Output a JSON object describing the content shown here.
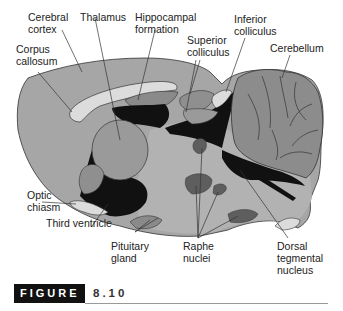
{
  "diagram": {
    "colors": {
      "tissue": "#a6a6a6",
      "tissue_light": "#c4c4c4",
      "white_matter": "#dcdcdc",
      "ventricle": "#111111",
      "nucleus_dark": "#5e5e5e",
      "outline": "#333333"
    },
    "labels": [
      {
        "id": "cerebral-cortex",
        "text": "Cerebral\ncortex"
      },
      {
        "id": "thalamus",
        "text": "Thalamus"
      },
      {
        "id": "hippocampal-formation",
        "text": "Hippocampal\nformation"
      },
      {
        "id": "inferior-colliculus",
        "text": "Inferior\ncolliculus"
      },
      {
        "id": "superior-colliculus",
        "text": "Superior\ncolliculus"
      },
      {
        "id": "cerebellum",
        "text": "Cerebellum"
      },
      {
        "id": "corpus-callosum",
        "text": "Corpus\ncallosum"
      },
      {
        "id": "optic-chiasm",
        "text": "Optic\nchiasm"
      },
      {
        "id": "third-ventricle",
        "text": "Third ventricle"
      },
      {
        "id": "pituitary-gland",
        "text": "Pituitary\ngland"
      },
      {
        "id": "raphe-nuclei",
        "text": "Raphe\nnuclei"
      },
      {
        "id": "dorsal-tegmental-nucleus",
        "text": "Dorsal\ntegmental\nnucleus"
      }
    ]
  },
  "figure": {
    "label": "FIGURE",
    "number": "8.10"
  }
}
